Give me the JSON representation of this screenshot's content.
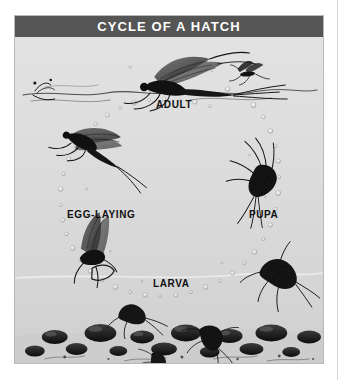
{
  "figure": {
    "title": "CYCLE OF A HATCH",
    "title_band_color": "#555555",
    "title_text_color": "#ffffff",
    "panel_background": "#dcdcdc",
    "panel_border_color": "#b9b9b9",
    "ink_color": "#1a1a1a"
  },
  "labels": {
    "adult": "ADULT",
    "egg_laying": "EGG-LAYING",
    "pupa": "PUPA",
    "larva": "LARVA"
  },
  "illustration": {
    "adult_mayfly": "adult-mayfly-icon",
    "small_flying_insect": "flying-insect-icon",
    "egg_laying_mayfly": "egg-laying-mayfly-icon",
    "emerging_mayfly": "emerging-mayfly-icon",
    "pupa_rising": "pupa-icon",
    "nymph": "nymph-icon",
    "riverbed": "riverbed-icon",
    "bubble_trail": "bubble-trail-icon",
    "waterline": "waterline-icon",
    "water_surface": "water-surface-icon"
  }
}
